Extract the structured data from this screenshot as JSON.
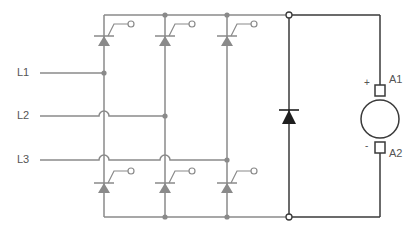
{
  "diagram": {
    "type": "three-phase half-controlled thyristor bridge with freewheeling diode driving DC motor",
    "colors": {
      "bridge_wire": "#8a8a8a",
      "load_wire": "#3a3a3a",
      "label": "#555555"
    },
    "inputs": [
      {
        "label": "L1"
      },
      {
        "label": "L2"
      },
      {
        "label": "L3"
      }
    ],
    "motor": {
      "terminal_top": "A1",
      "terminal_bottom": "A2",
      "polarity_top": "+",
      "polarity_bottom": "-"
    },
    "components": {
      "thyristors_upper": 3,
      "thyristors_lower": 3,
      "freewheeling_diode": 1
    }
  }
}
